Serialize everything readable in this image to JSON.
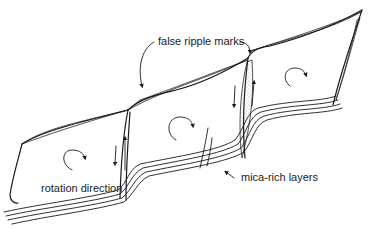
{
  "figure": {
    "type": "geological-sketch",
    "colors": {
      "ink": "#1a1a1a",
      "background": "#ffffff",
      "stipple": "#555555"
    }
  },
  "labels": {
    "false_ripple_marks": "false ripple marks",
    "rotation_direction": "rotation direction",
    "mica_rich_layers": "mica-rich layers"
  },
  "blocks": [
    {
      "name": "left-block",
      "rotation": "clockwise"
    },
    {
      "name": "middle-block",
      "rotation": "clockwise"
    },
    {
      "name": "right-block",
      "rotation": "clockwise"
    }
  ],
  "faults": [
    {
      "name": "left-fault",
      "sense": "down-left / up-right"
    },
    {
      "name": "right-fault",
      "sense": "down-left / up-right"
    }
  ]
}
